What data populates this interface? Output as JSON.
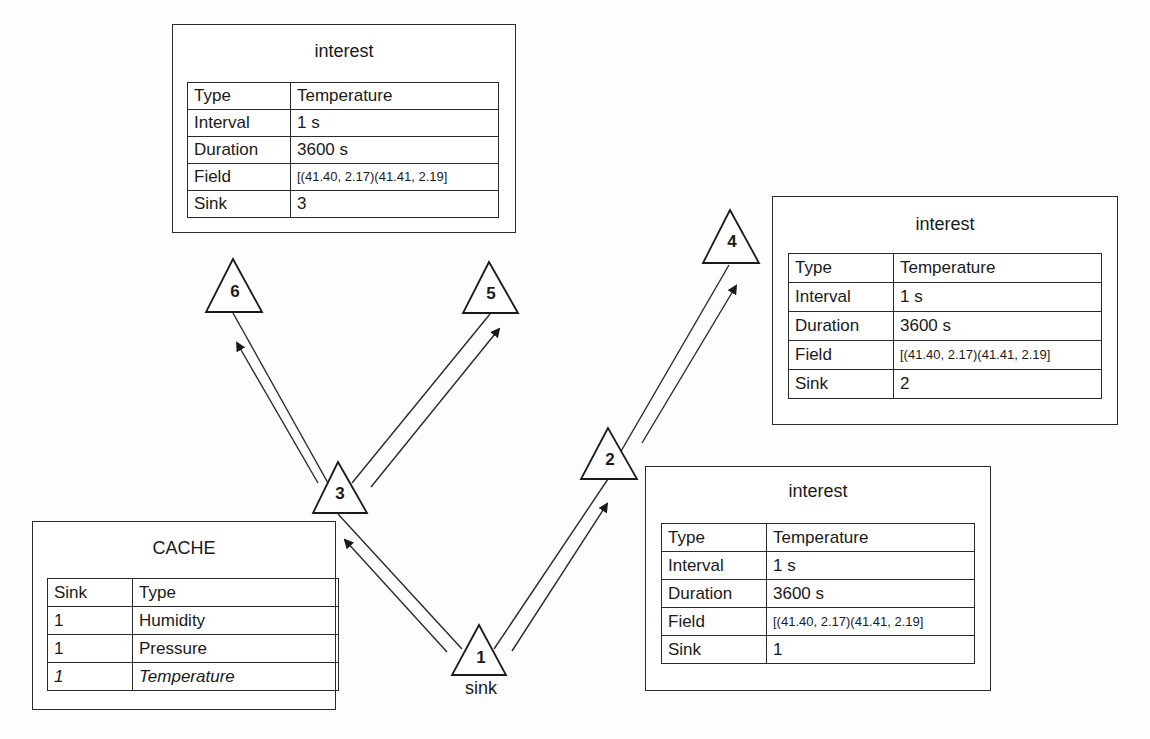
{
  "diagram": {
    "nodes": [
      {
        "id": "1",
        "label": "1",
        "sublabel": "sink"
      },
      {
        "id": "2",
        "label": "2"
      },
      {
        "id": "3",
        "label": "3"
      },
      {
        "id": "4",
        "label": "4"
      },
      {
        "id": "5",
        "label": "5"
      },
      {
        "id": "6",
        "label": "6"
      }
    ],
    "edges": [
      {
        "from": "1",
        "to": "3"
      },
      {
        "from": "1",
        "to": "2"
      },
      {
        "from": "3",
        "to": "6"
      },
      {
        "from": "3",
        "to": "5"
      },
      {
        "from": "2",
        "to": "4"
      }
    ],
    "interest_top": {
      "title": "interest",
      "rows": [
        {
          "key": "Type",
          "value": "Temperature"
        },
        {
          "key": "Interval",
          "value": "1 s"
        },
        {
          "key": "Duration",
          "value": "3600 s"
        },
        {
          "key": "Field",
          "value": "[(41.40, 2.17)(41.41, 2.19]"
        },
        {
          "key": "Sink",
          "value": "3"
        }
      ]
    },
    "interest_right": {
      "title": "interest",
      "rows": [
        {
          "key": "Type",
          "value": "Temperature"
        },
        {
          "key": "Interval",
          "value": "1 s"
        },
        {
          "key": "Duration",
          "value": "3600 s"
        },
        {
          "key": "Field",
          "value": "[(41.40, 2.17)(41.41, 2.19]"
        },
        {
          "key": "Sink",
          "value": "2"
        }
      ]
    },
    "interest_bottom": {
      "title": "interest",
      "rows": [
        {
          "key": "Type",
          "value": "Temperature"
        },
        {
          "key": "Interval",
          "value": "1 s"
        },
        {
          "key": "Duration",
          "value": "3600 s"
        },
        {
          "key": "Field",
          "value": "[(41.40, 2.17)(41.41, 2.19]"
        },
        {
          "key": "Sink",
          "value": "1"
        }
      ]
    },
    "cache": {
      "title": "CACHE",
      "header": {
        "sink": "Sink",
        "type": "Type"
      },
      "rows": [
        {
          "sink": "1",
          "type": "Humidity"
        },
        {
          "sink": "1",
          "type": "Pressure"
        },
        {
          "sink": "1",
          "type": "Temperature",
          "italic": true
        }
      ]
    }
  }
}
